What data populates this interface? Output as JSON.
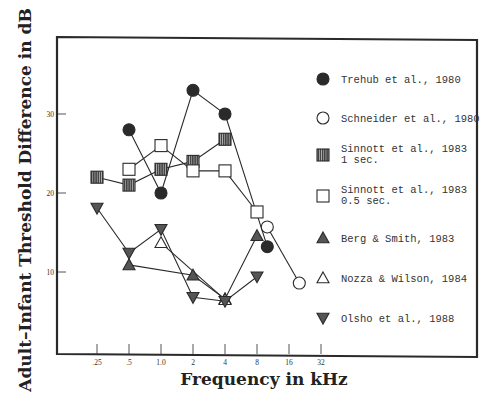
{
  "chart_data": {
    "type": "line",
    "title": "",
    "xlabel": "Frequency in kHz",
    "ylabel": "Adult–Infant Threshold Difference in dB",
    "x_scale": "log2",
    "x_ticks": [
      {
        "value": 0.25,
        "label": ".25"
      },
      {
        "value": 0.5,
        "label": ".5"
      },
      {
        "value": 1,
        "label": "1.0"
      },
      {
        "value": 2,
        "label": "2"
      },
      {
        "value": 4,
        "label": "4"
      },
      {
        "value": 8,
        "label": "8"
      },
      {
        "value": 16,
        "label": "16"
      },
      {
        "value": 32,
        "label": "32"
      }
    ],
    "y_ticks": [
      {
        "value": 10,
        "label": "10"
      },
      {
        "value": 20,
        "label": "20"
      },
      {
        "value": 30,
        "label": "30"
      }
    ],
    "ylim": [
      0,
      40
    ],
    "xlim": [
      0.125,
      64
    ],
    "grid": false,
    "legend_position": "right-inside",
    "series": [
      {
        "name": "Trehub et al., 1980",
        "label_lines": [
          "Trehub et al., 1980"
        ],
        "marker": "filled-circle",
        "points": [
          [
            0.5,
            28
          ],
          [
            1,
            20
          ],
          [
            2,
            33
          ],
          [
            4,
            30
          ],
          [
            10,
            13.2
          ]
        ]
      },
      {
        "name": "Schneider et al., 1980",
        "label_lines": [
          "Schneider et al., 1980"
        ],
        "marker": "open-circle",
        "points": [
          [
            10,
            15.7
          ],
          [
            20,
            8.6
          ]
        ]
      },
      {
        "name": "Sinnott et al., 1983 1 sec.",
        "label_lines": [
          "Sinnott et al., 1983",
          "1 sec."
        ],
        "marker": "hatched-square",
        "points": [
          [
            0.25,
            22
          ],
          [
            0.5,
            21
          ],
          [
            1,
            23
          ],
          [
            2,
            24
          ],
          [
            4,
            26.8
          ]
        ]
      },
      {
        "name": "Sinnott et al., 1983 0.5 sec.",
        "label_lines": [
          "Sinnott et al., 1983",
          "0.5 sec."
        ],
        "marker": "open-square",
        "points": [
          [
            0.5,
            23
          ],
          [
            1,
            26
          ],
          [
            2,
            22.8
          ],
          [
            4,
            22.8
          ],
          [
            8,
            17.6
          ]
        ]
      },
      {
        "name": "Berg & Smith, 1983",
        "label_lines": [
          "Berg & Smith, 1983"
        ],
        "marker": "filled-triangle",
        "points": [
          [
            0.5,
            10.9
          ],
          [
            2,
            9.6
          ],
          [
            4,
            6.6
          ],
          [
            8,
            14.6
          ]
        ]
      },
      {
        "name": "Nozza & Wilson, 1984",
        "label_lines": [
          "Nozza & Wilson, 1984"
        ],
        "marker": "open-triangle",
        "points": [
          [
            1,
            13.7
          ],
          [
            4,
            6.5
          ]
        ]
      },
      {
        "name": "Olsho et al., 1988",
        "label_lines": [
          "Olsho et al., 1988"
        ],
        "marker": "filled-inverted-triangle",
        "points": [
          [
            0.25,
            18.1
          ],
          [
            0.5,
            12.4
          ],
          [
            1,
            15.4
          ],
          [
            2,
            6.8
          ],
          [
            4,
            6.3
          ],
          [
            8,
            9.4
          ]
        ]
      }
    ]
  },
  "colors": {
    "ink": "#2a2a2a",
    "background": "#ffffff"
  }
}
